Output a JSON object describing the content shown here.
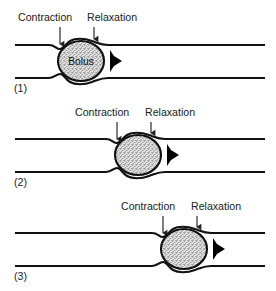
{
  "figure": {
    "background_color": "#ffffff",
    "line_color": "#111111",
    "arrow_color": "#000000",
    "bolus_fill_color": "#d9d9d9"
  },
  "labels": {
    "contraction": "Contraction",
    "relaxation": "Relaxation",
    "bolus": "Bolus"
  },
  "panels": [
    {
      "number": "(1)",
      "contraction_label": "Contraction",
      "relaxation_label": "Relaxation",
      "bolus_label": "Bolus",
      "bolus_center_x": 81,
      "bolus_center_y": 61,
      "bolus_radius": 21,
      "flow_direction": "right"
    },
    {
      "number": "(2)",
      "contraction_label": "Contraction",
      "relaxation_label": "Relaxation",
      "bolus_label": "",
      "bolus_center_x": 140,
      "bolus_center_y": 155,
      "bolus_radius": 21,
      "flow_direction": "right"
    },
    {
      "number": "(3)",
      "contraction_label": "Contraction",
      "relaxation_label": "Relaxation",
      "bolus_label": "",
      "bolus_center_x": 189,
      "bolus_center_y": 249,
      "bolus_radius": 21,
      "flow_direction": "right"
    }
  ]
}
